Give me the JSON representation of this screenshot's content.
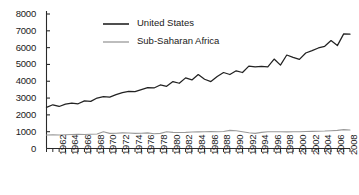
{
  "chart_data": {
    "type": "line",
    "title": "",
    "subtitle": "",
    "xlabel": "",
    "ylabel": "",
    "xlim": [
      1961,
      2009
    ],
    "ylim": [
      0,
      8000
    ],
    "grid": false,
    "legend_position": "top-center",
    "y_ticks": [
      0,
      1000,
      2000,
      3000,
      4000,
      5000,
      6000,
      7000,
      8000
    ],
    "y_tick_labels": [
      "0",
      "1000",
      "2000",
      "3000",
      "4000",
      "5000",
      "6000",
      "7000",
      "8000"
    ],
    "x_tick_labels": [
      "1962",
      "1964",
      "1966",
      "1968",
      "1970",
      "1972",
      "1974",
      "1976",
      "1978",
      "1980",
      "1982",
      "1984",
      "1986",
      "1988",
      "1990",
      "1992",
      "1994",
      "1996",
      "1998",
      "2000",
      "2002",
      "2004",
      "2006",
      "2008"
    ],
    "x": [
      1961,
      1962,
      1963,
      1964,
      1965,
      1966,
      1967,
      1968,
      1969,
      1970,
      1971,
      1972,
      1973,
      1974,
      1975,
      1976,
      1977,
      1978,
      1979,
      1980,
      1981,
      1982,
      1983,
      1984,
      1985,
      1986,
      1987,
      1988,
      1989,
      1990,
      1991,
      1992,
      1993,
      1994,
      1995,
      1996,
      1997,
      1998,
      1999,
      2000,
      2001,
      2002,
      2003,
      2004,
      2005,
      2006,
      2007,
      2008,
      2009
    ],
    "series": [
      {
        "name": "United States",
        "color": "#222222",
        "values": [
          2450,
          2600,
          2500,
          2640,
          2700,
          2660,
          2830,
          2800,
          3000,
          3080,
          3060,
          3200,
          3320,
          3400,
          3380,
          3500,
          3620,
          3600,
          3780,
          3700,
          3980,
          3880,
          4200,
          4080,
          4400,
          4120,
          3980,
          4280,
          4520,
          4400,
          4620,
          4520,
          4900,
          4850,
          4880,
          4860,
          5320,
          4960,
          5560,
          5420,
          5300,
          5680,
          5820,
          5980,
          6080,
          6420,
          6120,
          6820,
          6800
        ]
      },
      {
        "name": "Sub-Saharan Africa",
        "color": "#9a9a9a",
        "values": [
          800,
          810,
          800,
          820,
          830,
          840,
          830,
          850,
          860,
          1000,
          900,
          910,
          930,
          920,
          900,
          910,
          930,
          880,
          900,
          1000,
          960,
          950,
          960,
          980,
          990,
          1000,
          1010,
          1000,
          1010,
          1080,
          1060,
          1000,
          940,
          900,
          960,
          1000,
          1000,
          1000,
          990,
          1000,
          1000,
          1010,
          1020,
          1030,
          1040,
          1060,
          1080,
          1120,
          1100
        ]
      }
    ]
  },
  "legend": {
    "items": [
      {
        "label": "United States",
        "color": "#222222"
      },
      {
        "label": "Sub-Saharan Africa",
        "color": "#9a9a9a"
      }
    ]
  },
  "axes": {
    "axis_color": "#2a2a2a"
  }
}
